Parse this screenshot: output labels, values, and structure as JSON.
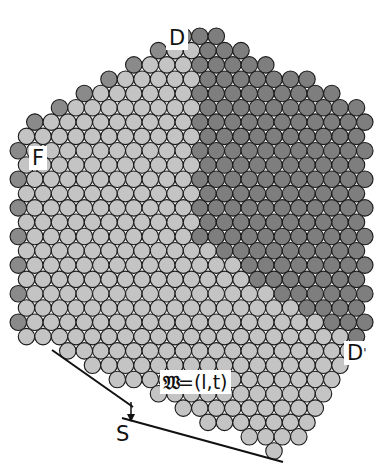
{
  "figure": {
    "type": "crystal-lattice-diagram",
    "colors": {
      "light_disc": "#c4c4c4",
      "dark_disc": "#7e7e7e",
      "edge_disc": "#8a8a8a",
      "outline": "#1a1a1a",
      "background": "#ffffff"
    },
    "lattice": {
      "disc_diameter": 16.5,
      "spacing_x": 16.5,
      "spacing_y": 14.3
    },
    "labels": {
      "top": "D",
      "left": "F",
      "right": "D",
      "right_prime": "'",
      "formula_symbol": "𝔚",
      "formula_rest": "=(l,t)",
      "step": "S"
    }
  }
}
